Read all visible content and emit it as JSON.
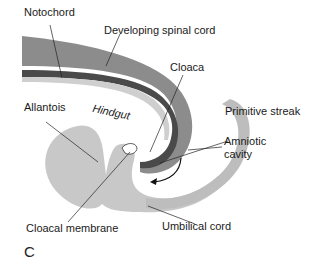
{
  "figure": {
    "panel_label": "C",
    "colors": {
      "background": "#ffffff",
      "dark_tissue": "#8c8c8c",
      "notochord": "#4a4a4a",
      "light_tissue": "#c8c8c8",
      "amnion": "#bdbdbd",
      "line": "#222222"
    },
    "labels": {
      "notochord": "Notochord",
      "spinal_cord": "Developing spinal cord",
      "cloaca": "Cloaca",
      "allantois": "Allantois",
      "hindgut": "Hindgut",
      "primitive_streak": "Primitive streak",
      "amniotic_cavity_line1": "Amniotic",
      "amniotic_cavity_line2": "cavity",
      "umbilical_cord": "Umbilical cord",
      "cloacal_membrane": "Cloacal membrane"
    }
  }
}
